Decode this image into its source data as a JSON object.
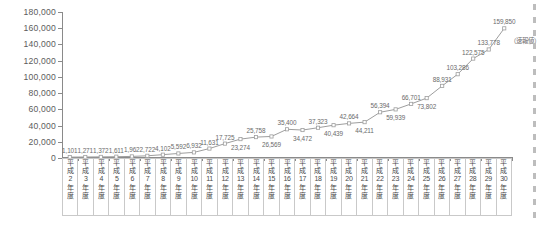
{
  "chart_data": {
    "type": "line",
    "title": "",
    "xlabel": "",
    "ylabel": "",
    "ylim": [
      0,
      180000
    ],
    "grid": false,
    "legend": null,
    "annotations": [
      "（速報値）"
    ],
    "ytick_labels": [
      "180,000",
      "160,000",
      "140,000",
      "120,000",
      "100,000",
      "80,000",
      "60,000",
      "40,000",
      "20,000",
      "0"
    ],
    "ytick_values": [
      180000,
      160000,
      140000,
      120000,
      100000,
      80000,
      60000,
      40000,
      20000,
      0
    ],
    "categories": [
      "平成2年度",
      "平成3年度",
      "平成4年度",
      "平成5年度",
      "平成6年度",
      "平成7年度",
      "平成8年度",
      "平成9年度",
      "平成10年度",
      "平成11年度",
      "平成12年度",
      "平成13年度",
      "平成14年度",
      "平成15年度",
      "平成16年度",
      "平成17年度",
      "平成18年度",
      "平成19年度",
      "平成20年度",
      "平成21年度",
      "平成22年度",
      "平成23年度",
      "平成24年度",
      "平成25年度",
      "平成26年度",
      "平成27年度",
      "平成28年度",
      "平成29年度",
      "平成30年度"
    ],
    "category_parts": [
      {
        "era": "平成",
        "num": "2",
        "suffix": "年度"
      },
      {
        "era": "平成",
        "num": "3",
        "suffix": "年度"
      },
      {
        "era": "平成",
        "num": "4",
        "suffix": "年度"
      },
      {
        "era": "平成",
        "num": "5",
        "suffix": "年度"
      },
      {
        "era": "平成",
        "num": "6",
        "suffix": "年度"
      },
      {
        "era": "平成",
        "num": "7",
        "suffix": "年度"
      },
      {
        "era": "平成",
        "num": "8",
        "suffix": "年度"
      },
      {
        "era": "平成",
        "num": "9",
        "suffix": "年度"
      },
      {
        "era": "平成",
        "num": "10",
        "suffix": "年度"
      },
      {
        "era": "平成",
        "num": "11",
        "suffix": "年度"
      },
      {
        "era": "平成",
        "num": "12",
        "suffix": "年度"
      },
      {
        "era": "平成",
        "num": "13",
        "suffix": "年度"
      },
      {
        "era": "平成",
        "num": "14",
        "suffix": "年度"
      },
      {
        "era": "平成",
        "num": "15",
        "suffix": "年度"
      },
      {
        "era": "平成",
        "num": "16",
        "suffix": "年度"
      },
      {
        "era": "平成",
        "num": "17",
        "suffix": "年度"
      },
      {
        "era": "平成",
        "num": "18",
        "suffix": "年度"
      },
      {
        "era": "平成",
        "num": "19",
        "suffix": "年度"
      },
      {
        "era": "平成",
        "num": "20",
        "suffix": "年度"
      },
      {
        "era": "平成",
        "num": "21",
        "suffix": "年度"
      },
      {
        "era": "平成",
        "num": "22",
        "suffix": "年度"
      },
      {
        "era": "平成",
        "num": "23",
        "suffix": "年度"
      },
      {
        "era": "平成",
        "num": "24",
        "suffix": "年度"
      },
      {
        "era": "平成",
        "num": "25",
        "suffix": "年度"
      },
      {
        "era": "平成",
        "num": "26",
        "suffix": "年度"
      },
      {
        "era": "平成",
        "num": "27",
        "suffix": "年度"
      },
      {
        "era": "平成",
        "num": "28",
        "suffix": "年度"
      },
      {
        "era": "平成",
        "num": "29",
        "suffix": "年度"
      },
      {
        "era": "平成",
        "num": "30",
        "suffix": "年度"
      }
    ],
    "values": [
      1101,
      1271,
      1372,
      1611,
      1962,
      2722,
      4102,
      5592,
      6932,
      11631,
      17725,
      23274,
      25758,
      26569,
      35400,
      34472,
      37323,
      40439,
      42664,
      44211,
      56394,
      59939,
      66701,
      73802,
      88931,
      103286,
      122575,
      133778,
      159850
    ],
    "value_labels": [
      "1,101",
      "1,271",
      "1,372",
      "1,611",
      "1,962",
      "2,722",
      "4,102",
      "5,592",
      "6,932",
      "11,631",
      "17,725",
      "23,274",
      "25,758",
      "26,569",
      "35,400",
      "34,472",
      "37,323",
      "40,439",
      "42,664",
      "44,211",
      "56,394",
      "59,939",
      "66,701",
      "73,802",
      "88,931",
      "103,286",
      "122,575",
      "133,778",
      "159,850"
    ],
    "label_positions": [
      "above",
      "above",
      "above",
      "above",
      "above",
      "above",
      "above",
      "above",
      "above",
      "above",
      "above",
      "below",
      "above",
      "below",
      "above",
      "below",
      "above",
      "below",
      "above",
      "below",
      "above",
      "below",
      "above",
      "below",
      "above",
      "above",
      "above",
      "above",
      "above"
    ],
    "series_color": "#9e9e9e",
    "marker_color": "#ffffff",
    "axis_color": "#8a8a8a",
    "text_color": "#5c5c5c"
  }
}
